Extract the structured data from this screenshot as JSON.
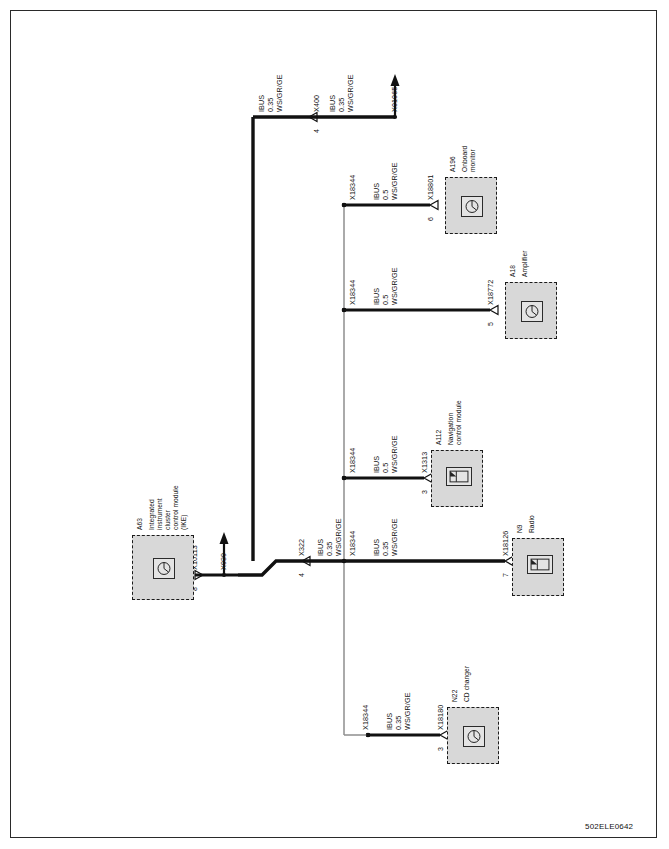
{
  "document": {
    "title": "BMW I-Bus wiring diagram",
    "figure_code": "502ELE0642"
  },
  "wire_specs": {
    "bus_name": "IBUS",
    "gauge_035": "0.35",
    "gauge_05": "0.5",
    "color_code": "WS/GR/GE"
  },
  "components": [
    {
      "id": "ike",
      "ref": "A63",
      "name_lines": [
        "Integrated",
        "instrument",
        "cluster",
        "control module",
        "(IKE)"
      ],
      "connector": "X10113",
      "pin": "8",
      "icon": "module-round-icon"
    },
    {
      "id": "radio",
      "ref": "N9",
      "name_lines": [
        "Radio"
      ],
      "connector": "X18126",
      "pin": "7",
      "icon": "module-screen-icon"
    },
    {
      "id": "navigation",
      "ref": "A112",
      "name_lines": [
        "Navigation",
        "control module"
      ],
      "connector": "X1313",
      "pin": "3",
      "icon": "module-screen-icon"
    },
    {
      "id": "amplifier",
      "ref": "A18",
      "name_lines": [
        "Amplifier"
      ],
      "connector": "X18772",
      "pin": "5",
      "icon": "module-round-icon"
    },
    {
      "id": "onboard-monitor",
      "ref": "A196",
      "name_lines": [
        "Onboard",
        "monitor"
      ],
      "connector": "X18801",
      "pin": "6",
      "icon": "module-round-icon"
    },
    {
      "id": "cd-changer",
      "ref": "N22",
      "name_lines": [
        "CD changer"
      ],
      "connector": "X18180",
      "pin": "3",
      "icon": "module-round-icon"
    }
  ],
  "connectors": {
    "x400": "X400",
    "x400_pin": "4",
    "x01065": "X01065",
    "x939": "X939",
    "x322": "X322",
    "x322_pin": "4",
    "x10113": "X10113",
    "x10113_pin": "8",
    "x18344": "X18344",
    "x18126": "X18126",
    "x18126_pin": "7",
    "x1313": "X1313",
    "x1313_pin": "3",
    "x18772": "X18772",
    "x18772_pin": "5",
    "x18801": "X18801",
    "x18801_pin": "6",
    "x18180": "X18180",
    "x18180_pin": "3"
  },
  "wire_labels": {
    "top_left": {
      "bus": "IBUS",
      "gauge": "0.35",
      "color": "WS/GR/GE"
    },
    "top_right": {
      "bus": "IBUS",
      "gauge": "0.35",
      "color": "WS/GR/GE"
    },
    "monitor_branch": {
      "bus": "IBUS",
      "gauge": "0.5",
      "color": "WS/GR/GE"
    },
    "amplifier_branch": {
      "bus": "IBUS",
      "gauge": "0.5",
      "color": "WS/GR/GE"
    },
    "navigation_branch": {
      "bus": "IBUS",
      "gauge": "0.5",
      "color": "WS/GR/GE"
    },
    "ike_main": {
      "bus": "IBUS",
      "gauge": "0.35",
      "color": "WS/GR/GE"
    },
    "radio_main": {
      "bus": "IBUS",
      "gauge": "0.35",
      "color": "WS/GR/GE"
    },
    "cd_branch": {
      "bus": "IBUS",
      "gauge": "0.35",
      "color": "WS/GR/GE"
    }
  },
  "colors": {
    "wire": "#111111",
    "splice": "#8e8e8e",
    "component_fill": "#d8d8d8",
    "component_stroke": "#1b1b1b",
    "frame": "#2a2a2a"
  }
}
